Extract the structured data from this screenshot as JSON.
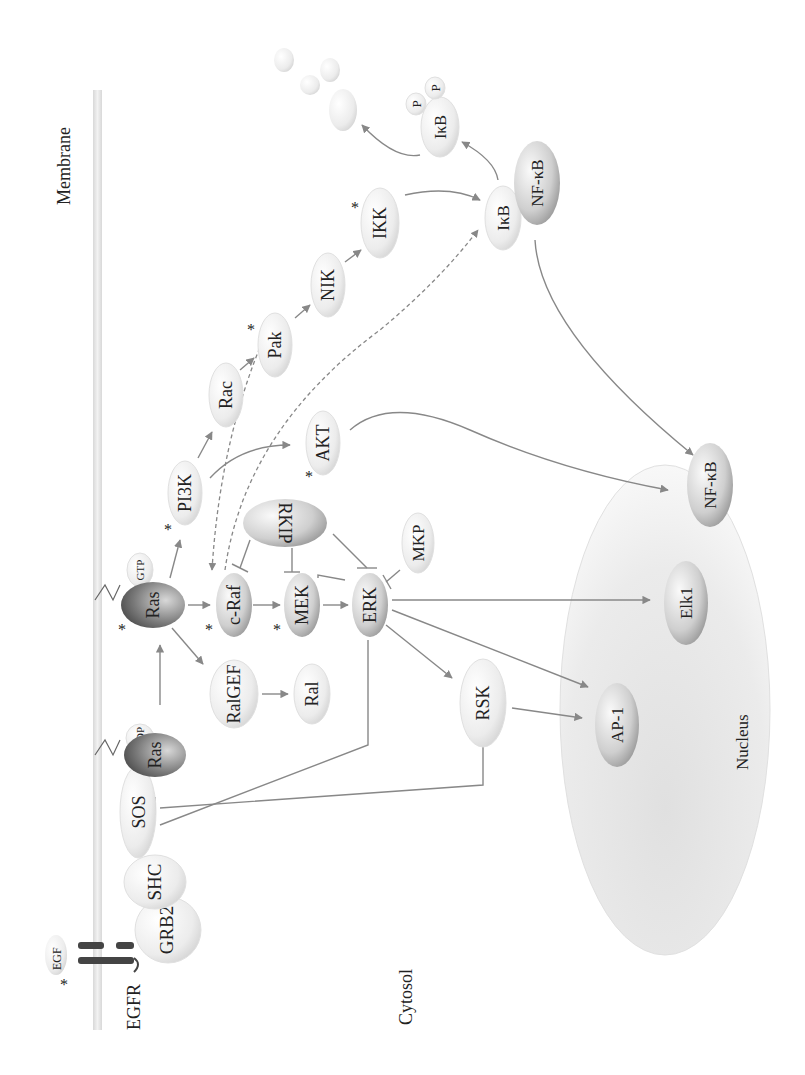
{
  "compartments": {
    "membrane": "Membrane",
    "cytosol": "Cytosol",
    "nucleus": "Nucleus"
  },
  "receptor": {
    "ligand": "EGF",
    "receptor": "EGFR"
  },
  "nodes": {
    "grb2": "GRB2",
    "shc": "SHC",
    "sos": "SOS",
    "ras_gdp": "Ras",
    "gdp": "GDP",
    "ras_gtp": "Ras",
    "gtp": "GTP",
    "ralgef": "RalGEF",
    "ral": "Ral",
    "craf": "c-Raf",
    "mek": "MEK",
    "erk": "ERK",
    "rkip": "RKIP",
    "mkp": "MKP",
    "rsk": "RSK",
    "pi3k": "PI3K",
    "akt": "AKT",
    "rac": "Rac",
    "pak": "Pak",
    "nik": "NIK",
    "ikk": "IKK",
    "ikb": "IκB",
    "nfkb": "NF-κB",
    "ikb_p": "IκB",
    "p1": "P",
    "p2": "P",
    "nfkb_nuc": "NF-κB",
    "elk1": "Elk1",
    "ap1": "AP-1"
  },
  "marker": "*",
  "colors": {
    "membrane": "#e2e2e2",
    "arrow": "#888888",
    "nucleus": "#e6e6e6",
    "node_light": "#f4f4f4",
    "node_dark": "#555555"
  }
}
